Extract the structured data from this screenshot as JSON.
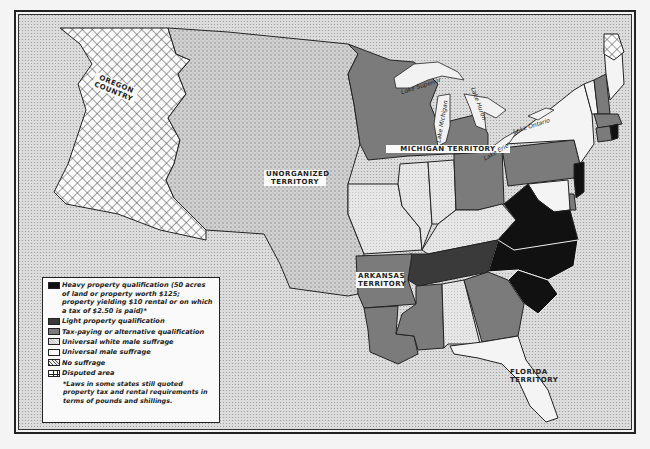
{
  "map": {
    "regions": {
      "oregon": "OREGON COUNTRY",
      "unorganized": "UNORGANIZED TERRITORY",
      "michigan": "MICHIGAN TERRITORY",
      "arkansas": "ARKANSAS TERRITORY",
      "florida": "FLORIDA TERRITORY"
    },
    "lakes": {
      "superior": "Lake Superior",
      "michigan": "Lake Michigan",
      "huron": "Lake Huron",
      "erie": "Lake Erie",
      "ontario": "Lake Ontario"
    }
  },
  "legend": {
    "items": [
      {
        "key": "heavy",
        "label": "Heavy property qualification (50 acres of land or property worth $125; property yielding $10 rental or on which a tax of $2.50 is paid)*",
        "color": "#111111"
      },
      {
        "key": "light",
        "label": "Light property qualification",
        "color": "#3a3a3a"
      },
      {
        "key": "tax",
        "label": "Tax-paying or alternative qualification",
        "color": "#7a7a7a"
      },
      {
        "key": "white",
        "label": "Universal white male suffrage",
        "color": "#cfcfcf"
      },
      {
        "key": "universal",
        "label": "Universal male suffrage",
        "color": "#fafafa"
      },
      {
        "key": "none",
        "label": "No suffrage",
        "color": "#e0e0e0"
      },
      {
        "key": "disputed",
        "label": "Disputed area",
        "color": "#ffffff"
      }
    ],
    "note": "*Laws in some states still quoted property tax and rental requirements in terms of pounds and shillings."
  },
  "colors": {
    "background": "#d6d6d6",
    "heavy": "#111111",
    "light": "#3a3a3a",
    "tax": "#7b7b7b",
    "white_male": "#c8c8c8",
    "universal": "#f7f7f7",
    "border": "#222222"
  }
}
